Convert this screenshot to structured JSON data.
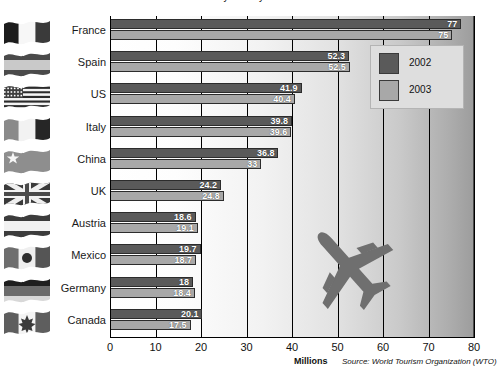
{
  "chart_data": {
    "type": "bar",
    "orientation": "horizontal",
    "title": "International tourist arrivals by country",
    "categories": [
      "France",
      "Spain",
      "US",
      "Italy",
      "China",
      "UK",
      "Austria",
      "Mexico",
      "Germany",
      "Canada"
    ],
    "series": [
      {
        "name": "2002",
        "color": "#5a5a5a",
        "values": [
          77,
          52.3,
          41.9,
          39.8,
          36.8,
          24.2,
          18.6,
          19.7,
          18,
          20.1
        ],
        "labels": [
          "77",
          "52.3",
          "41.9",
          "39.8",
          "36.8",
          "24.2",
          "18.6",
          "19.7",
          "18",
          "20.1"
        ]
      },
      {
        "name": "2003",
        "color": "#a8a8a8",
        "values": [
          75,
          52.5,
          40.4,
          39.6,
          33,
          24.8,
          19.1,
          18.7,
          18.4,
          17.5
        ],
        "labels": [
          "75",
          "52.5",
          "40.4",
          "39.6",
          "33",
          "24.8",
          "19.1",
          "18.7",
          "18.4",
          "17.5"
        ]
      }
    ],
    "xlabel": "Millions",
    "ylabel": "",
    "xlim": [
      0,
      80
    ],
    "xticks": [
      "0",
      "10",
      "20",
      "30",
      "40",
      "50",
      "60",
      "70",
      "80"
    ],
    "grid": true,
    "legend_position": "top-right",
    "source": "Source: World Tourism Organization (WTO)"
  },
  "legend": {
    "items": [
      {
        "label": "2002",
        "swatch": "legend-swatch-2002"
      },
      {
        "label": "2003",
        "swatch": "legend-swatch-2003"
      }
    ]
  },
  "flags": [
    {
      "country": "France",
      "icon": "flag-france-icon"
    },
    {
      "country": "Spain",
      "icon": "flag-spain-icon"
    },
    {
      "country": "US",
      "icon": "flag-us-icon"
    },
    {
      "country": "Italy",
      "icon": "flag-italy-icon"
    },
    {
      "country": "China",
      "icon": "flag-china-icon"
    },
    {
      "country": "UK",
      "icon": "flag-uk-icon"
    },
    {
      "country": "Austria",
      "icon": "flag-austria-icon"
    },
    {
      "country": "Mexico",
      "icon": "flag-mexico-icon"
    },
    {
      "country": "Germany",
      "icon": "flag-germany-icon"
    },
    {
      "country": "Canada",
      "icon": "flag-canada-icon"
    }
  ],
  "decoration": {
    "airplane": "airplane-icon"
  },
  "colors": {
    "bar_2002": "#5a5a5a",
    "bar_2003": "#a8a8a8",
    "axis": "#000000",
    "value_text": "#ffffff"
  }
}
